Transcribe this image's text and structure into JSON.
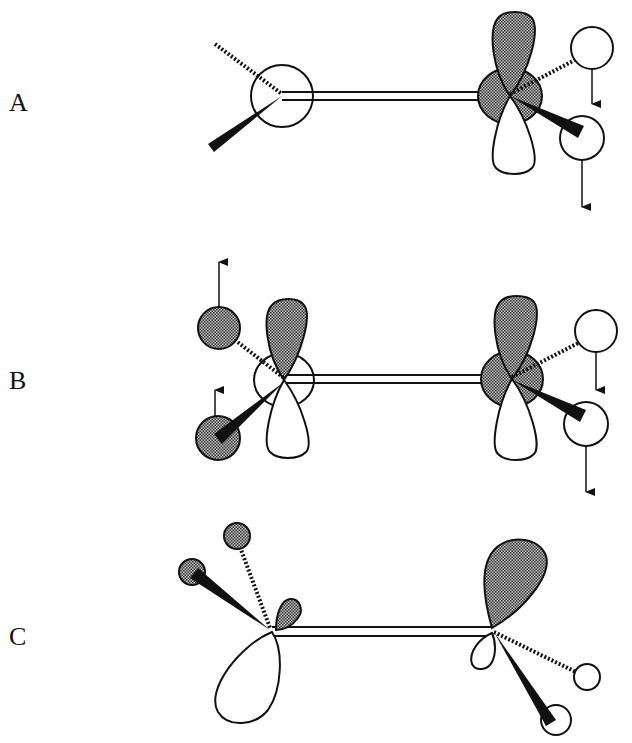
{
  "figure": {
    "panels": [
      {
        "label": "A",
        "annotation": "left carbon: s-type circle; right carbon: p-orbital (shaded top lobe) with two H atoms displaced downward (arrows)"
      },
      {
        "label": "B",
        "annotation": "both carbons: p-orbitals; left H atoms shaded with upward arrows; right H atoms unshaded with downward arrows"
      },
      {
        "label": "C",
        "annotation": "pyramidalized carbons: left has large unshaded lobe below and small shaded lobe, shaded H atoms; right has large shaded lobe and small unshaded lobe, unshaded H atoms"
      }
    ]
  },
  "colors": {
    "ink": "#111111",
    "shade": "#7a7a7a",
    "background": "#ffffff"
  }
}
